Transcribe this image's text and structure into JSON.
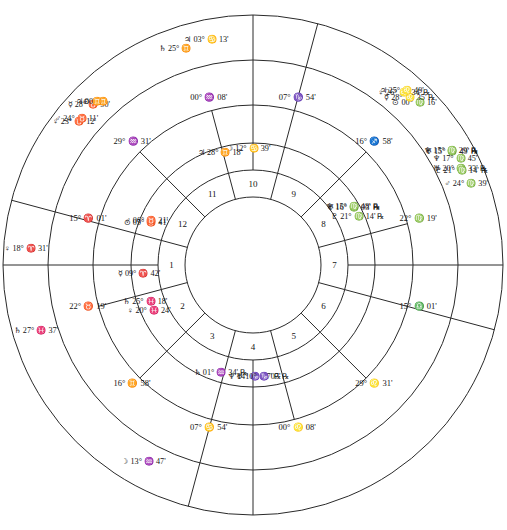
{
  "chart": {
    "type": "astrological-wheel",
    "rings": [
      "outer-transit-ring",
      "outer-cusp-ring",
      "inner-natal-ring",
      "inner-cusp-ring",
      "house-number-ring",
      "center-disc"
    ],
    "center": {
      "cx": 253,
      "cy": 265
    },
    "radii": {
      "r_outer": 250,
      "r_ring2": 205,
      "r_ring3": 160,
      "r_ring4": 122,
      "r_ring5": 95,
      "r_center": 68
    },
    "axis_rotation_deg": 15.02
  },
  "glyphs": {
    "sun": "⊙",
    "moon": "☽",
    "mercury": "☿",
    "venus": "♀",
    "mars": "♂",
    "jupiter": "♃",
    "saturn": "♄",
    "uranus": "♅",
    "neptune": "♆",
    "pluto": "♇",
    "retrograde": "℞",
    "aries": "♈",
    "taurus": "♉",
    "gemini": "♊",
    "cancer": "♋",
    "leo": "♌",
    "virgo": "♍",
    "libra": "♎",
    "scorpio": "♏",
    "sagittarius": "♐",
    "capricorn": "♑",
    "aquarius": "♒",
    "pisces": "♓"
  },
  "inner_wheel": {
    "name": "natal-planets",
    "planets": [
      {
        "planet": "neptune",
        "deg": "14°",
        "sign": "capricorn",
        "min": "17'",
        "retro": true
      },
      {
        "planet": "uranus",
        "deg": "10°",
        "sign": "capricorn",
        "min": "07'",
        "retro": true
      },
      {
        "planet": "saturn",
        "deg": "01°",
        "sign": "aquarius",
        "min": "34'",
        "retro": true
      },
      {
        "planet": "venus",
        "deg": "20°",
        "sign": "pisces",
        "min": "24'",
        "retro": false
      },
      {
        "planet": "saturn2",
        "deg": "25°",
        "sign": "pisces",
        "min": "18'",
        "retro": false
      },
      {
        "planet": "mercury",
        "deg": "09°",
        "sign": "aries",
        "min": "42'",
        "retro": false
      },
      {
        "planet": "sun",
        "deg": "05°",
        "sign": "taurus",
        "min": "41'",
        "retro": false
      },
      {
        "planet": "mars",
        "deg": "06°",
        "sign": "taurus",
        "min": "21'",
        "retro": false
      },
      {
        "planet": "jupiter",
        "deg": "28°",
        "sign": "gemini",
        "min": "18'",
        "retro": false
      },
      {
        "planet": "moon",
        "deg": "12°",
        "sign": "cancer",
        "min": "39'",
        "retro": false
      },
      {
        "planet": "uranus2",
        "deg": "16°",
        "sign": "virgo",
        "min": "03'",
        "retro": true
      },
      {
        "planet": "neptune2",
        "deg": "15°",
        "sign": "virgo",
        "min": "48'",
        "retro": true
      },
      {
        "planet": "pluto",
        "deg": "21°",
        "sign": "virgo",
        "min": "14'",
        "retro": true
      }
    ]
  },
  "outer_wheel": {
    "name": "transit-planets",
    "planets": [
      {
        "planet": "moon",
        "deg": "13°",
        "sign": "aquarius",
        "min": "47'",
        "retro": false
      },
      {
        "planet": "saturn",
        "deg": "27°",
        "sign": "pisces",
        "min": "37'",
        "retro": false
      },
      {
        "planet": "venus",
        "deg": "18°",
        "sign": "aries",
        "min": "31'",
        "retro": false
      },
      {
        "planet": "mercury",
        "deg": "28°",
        "sign": "taurus",
        "min": "50'",
        "retro": false
      },
      {
        "planet": "venus2",
        "deg": "23°",
        "sign": "taurus",
        "min": "12'",
        "retro": false
      },
      {
        "planet": "mars",
        "deg": "24°",
        "sign": "taurus",
        "min": "11'",
        "retro": false
      },
      {
        "planet": "saturn2",
        "deg": "25°",
        "sign": "gemini",
        "min": "",
        "retro": false
      },
      {
        "planet": "jupiter",
        "deg": "00°",
        "sign": "gemini",
        "min": "",
        "retro": false
      },
      {
        "planet": "sun2",
        "deg": "",
        "sign": "gemini",
        "min": "",
        "retro": false
      },
      {
        "planet": "jupiter2",
        "deg": "03°",
        "sign": "cancer",
        "min": "13'",
        "retro": false
      },
      {
        "planet": "uranus",
        "deg": "15°",
        "sign": "virgo",
        "min": "49'",
        "retro": true
      },
      {
        "planet": "neptune",
        "deg": "15°",
        "sign": "virgo",
        "min": "29'",
        "retro": true
      },
      {
        "planet": "mars2",
        "deg": "24°",
        "sign": "virgo",
        "min": "39'",
        "retro": false
      },
      {
        "planet": "sun",
        "deg": "00°",
        "sign": "virgo",
        "min": "16'",
        "retro": false
      },
      {
        "planet": "mercury2",
        "deg": "28°",
        "sign": "leo",
        "min": "35'",
        "retro": true
      },
      {
        "planet": "venus3",
        "deg": "26°",
        "sign": "leo",
        "min": "34'",
        "retro": true
      },
      {
        "planet": "jupiter3",
        "deg": "25°",
        "sign": "leo",
        "min": "49'",
        "retro": false
      },
      {
        "planet": "uranus2",
        "deg": "20°",
        "sign": "virgo",
        "min": "33'",
        "retro": true
      },
      {
        "planet": "neptune2",
        "deg": "17°",
        "sign": "virgo",
        "min": "45'",
        "retro": false
      },
      {
        "planet": "pluto",
        "deg": "21°",
        "sign": "virgo",
        "min": "14'",
        "retro": true
      }
    ]
  },
  "cusps": [
    {
      "house": 1,
      "deg": "15°",
      "sign": "aries",
      "min": "01'",
      "label": "ASC"
    },
    {
      "house": 2,
      "deg": "22°",
      "sign": "taurus",
      "min": "19'",
      "label": ""
    },
    {
      "house": 3,
      "deg": "16°",
      "sign": "gemini",
      "min": "58'",
      "label": ""
    },
    {
      "house": 4,
      "deg": "07°",
      "sign": "cancer",
      "min": "54'",
      "label": "IC"
    },
    {
      "house": 5,
      "deg": "00°",
      "sign": "leo",
      "min": "08'",
      "label": ""
    },
    {
      "house": 6,
      "deg": "29°",
      "sign": "leo",
      "min": "31'",
      "label": ""
    },
    {
      "house": 7,
      "deg": "15°",
      "sign": "libra",
      "min": "01'",
      "label": "DSC"
    },
    {
      "house": 8,
      "deg": "22°",
      "sign": "virgo",
      "min": "19'",
      "label": ""
    },
    {
      "house": 9,
      "deg": "16°",
      "sign": "sagittarius",
      "min": "58'",
      "label": ""
    },
    {
      "house": 10,
      "deg": "07°",
      "sign": "capricorn",
      "min": "54'",
      "label": "MC"
    },
    {
      "house": 11,
      "deg": "00°",
      "sign": "aquarius",
      "min": "08'",
      "label": ""
    },
    {
      "house": 12,
      "deg": "29°",
      "sign": "aquarius",
      "min": "31'",
      "label": ""
    }
  ],
  "outer_cusps": [
    {
      "deg": "02°",
      "sign": "aquarius",
      "min": "51'"
    },
    {
      "deg": "19°",
      "sign": "taurus",
      "min": ""
    },
    {
      "deg": "16°",
      "sign": "gemini",
      "min": ""
    },
    {
      "deg": "19°",
      "sign": "gemini",
      "min": ""
    }
  ],
  "house_numbers": [
    "1",
    "2",
    "3",
    "4",
    "5",
    "6",
    "7",
    "8",
    "9",
    "10",
    "11",
    "12"
  ],
  "colors": {
    "stroke": "#2a2a2a",
    "text": "#141414",
    "background": "#ffffff"
  }
}
